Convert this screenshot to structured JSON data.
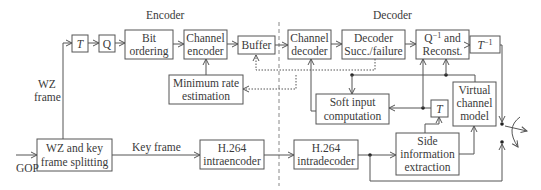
{
  "sections": {
    "encoder": "Encoder",
    "decoder": "Decoder"
  },
  "blocks": {
    "t": "T",
    "q": "Q",
    "bit_ordering": [
      "Bit",
      "ordering"
    ],
    "channel_encoder": [
      "Channel",
      "encoder"
    ],
    "buffer": "Buffer",
    "min_rate": [
      "Minimum rate",
      "estimation"
    ],
    "wz_split": [
      "WZ and key",
      "frame splitting"
    ],
    "h264_intraenc": [
      "H.264",
      "intraencoder"
    ],
    "channel_decoder": [
      "Channel",
      "decoder"
    ],
    "decoder_succ": [
      "Decoder",
      "Succ./failure"
    ],
    "qinv": [
      "Q",
      "−1",
      " and",
      "Reconst."
    ],
    "tinv": [
      "T",
      "−1"
    ],
    "soft_input": [
      "Soft input",
      "computation"
    ],
    "h264_intradec": [
      "H.264",
      "intradecoder"
    ],
    "side_info": [
      "Side",
      "information",
      "extraction"
    ],
    "t2": "T",
    "virtual_channel": [
      "Virtual",
      "channel",
      "model"
    ]
  },
  "labels": {
    "wz_frame": [
      "WZ",
      "frame"
    ],
    "key_frame": "Key frame",
    "gop": "GOP"
  }
}
